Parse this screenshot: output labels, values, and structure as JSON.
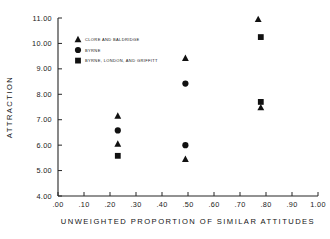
{
  "chart_data": {
    "type": "scatter",
    "title": "",
    "xlabel": "UNWEIGHTED PROPORTION OF SIMILAR ATTITUDES",
    "ylabel": "ATTRACTION",
    "xlim": [
      0.0,
      1.0
    ],
    "ylim": [
      4.0,
      11.0
    ],
    "grid": false,
    "legend_position": "upper-left-inside",
    "xticks": [
      0.0,
      0.1,
      0.2,
      0.3,
      0.4,
      0.5,
      0.6,
      0.7,
      0.8,
      0.9,
      1.0
    ],
    "xticklabels": [
      ".00",
      ".10",
      ".20",
      ".30",
      ".40",
      ".50",
      ".60",
      ".70",
      ".80",
      ".90",
      "1.00"
    ],
    "yticks": [
      4.0,
      5.0,
      6.0,
      7.0,
      8.0,
      9.0,
      10.0,
      11.0
    ],
    "yticklabels": [
      "4.00",
      "5.00",
      "6.00",
      "7.00",
      "8.00",
      "9.00",
      "10.00",
      "11.00"
    ],
    "series": [
      {
        "name": "CLORE AND BALDRIDGE",
        "marker": "triangle",
        "color": "#111111",
        "points": [
          {
            "x": 0.23,
            "y": 7.15
          },
          {
            "x": 0.23,
            "y": 6.05
          },
          {
            "x": 0.49,
            "y": 9.42
          },
          {
            "x": 0.49,
            "y": 5.45
          },
          {
            "x": 0.77,
            "y": 10.95
          },
          {
            "x": 0.78,
            "y": 7.48
          }
        ]
      },
      {
        "name": "BYRNE",
        "marker": "circle",
        "color": "#111111",
        "points": [
          {
            "x": 0.23,
            "y": 6.58
          },
          {
            "x": 0.49,
            "y": 8.42
          },
          {
            "x": 0.49,
            "y": 6.0
          }
        ]
      },
      {
        "name": "BYRNE, LONDON, AND GRIFFITT",
        "marker": "square",
        "color": "#111111",
        "points": [
          {
            "x": 0.23,
            "y": 5.58
          },
          {
            "x": 0.78,
            "y": 10.25
          },
          {
            "x": 0.78,
            "y": 7.7
          }
        ]
      }
    ]
  }
}
